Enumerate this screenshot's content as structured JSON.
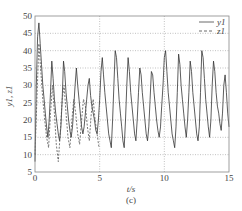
{
  "chart_data": {
    "type": "line",
    "title": "",
    "caption": "(c)",
    "xlabel": "t/s",
    "ylabel": "y1, z1",
    "xlim": [
      0,
      15
    ],
    "ylim": [
      5,
      50
    ],
    "xticks": [
      0,
      5,
      10,
      15
    ],
    "yticks": [
      5,
      10,
      15,
      20,
      25,
      30,
      35,
      40,
      45,
      50
    ],
    "grid": true,
    "grid_style": "dotted",
    "legend_position": "upper right",
    "legend": [
      {
        "label": "y1",
        "style": "solid"
      },
      {
        "label": "z1",
        "style": "dashed"
      }
    ],
    "series": [
      {
        "name": "y1",
        "style": "solid",
        "x": [
          0,
          0.1,
          0.2,
          0.3,
          0.4,
          0.5,
          0.6,
          0.7,
          0.8,
          0.9,
          1.0,
          1.1,
          1.2,
          1.3,
          1.4,
          1.5,
          1.6,
          1.7,
          1.8,
          1.9,
          2.0,
          2.1,
          2.2,
          2.3,
          2.4,
          2.5,
          2.6,
          2.7,
          2.8,
          2.9,
          3.0,
          3.1,
          3.2,
          3.3,
          3.4,
          3.5,
          3.6,
          3.7,
          3.8,
          3.9,
          4.0,
          4.1,
          4.2,
          4.3,
          4.4,
          4.5,
          4.6,
          4.7,
          4.8,
          4.9,
          5.0,
          5.1,
          5.2,
          5.3,
          5.4,
          5.5,
          5.6,
          5.7,
          5.8,
          5.9,
          6.0,
          6.1,
          6.2,
          6.3,
          6.4,
          6.5,
          6.6,
          6.7,
          6.8,
          6.9,
          7.0,
          7.1,
          7.2,
          7.3,
          7.4,
          7.5,
          7.6,
          7.7,
          7.8,
          7.9,
          8.0,
          8.1,
          8.2,
          8.3,
          8.4,
          8.5,
          8.6,
          8.7,
          8.8,
          8.9,
          9.0,
          9.1,
          9.2,
          9.3,
          9.4,
          9.5,
          9.6,
          9.7,
          9.8,
          9.9,
          10.0,
          10.1,
          10.2,
          10.3,
          10.4,
          10.5,
          10.6,
          10.7,
          10.8,
          10.9,
          11.0,
          11.1,
          11.2,
          11.3,
          11.4,
          11.5,
          11.6,
          11.7,
          11.8,
          11.9,
          12.0,
          12.1,
          12.2,
          12.3,
          12.4,
          12.5,
          12.6,
          12.7,
          12.8,
          12.9,
          13.0,
          13.1,
          13.2,
          13.3,
          13.4,
          13.5,
          13.6,
          13.7,
          13.8,
          13.9,
          14.0,
          14.1,
          14.2,
          14.3,
          14.4,
          14.5,
          14.6,
          14.7,
          14.8,
          14.9,
          15.0
        ],
        "values": [
          8,
          30,
          44,
          48,
          42,
          36,
          30,
          26,
          22,
          18,
          15,
          20,
          28,
          37,
          32,
          26,
          22,
          19,
          16,
          14,
          18,
          26,
          37,
          34,
          28,
          24,
          20,
          17,
          15,
          18,
          24,
          30,
          35,
          30,
          26,
          22,
          18,
          16,
          18,
          22,
          26,
          30,
          32,
          27,
          24,
          22,
          20,
          17,
          16,
          20,
          26,
          34,
          38,
          33,
          28,
          24,
          20,
          16,
          14,
          12,
          20,
          30,
          40,
          38,
          32,
          26,
          22,
          18,
          14,
          12,
          20,
          30,
          38,
          34,
          28,
          24,
          20,
          16,
          14,
          20,
          28,
          35,
          33,
          28,
          24,
          20,
          16,
          14,
          18,
          26,
          34,
          33,
          28,
          24,
          20,
          17,
          15,
          18,
          24,
          30,
          38,
          40,
          34,
          28,
          24,
          20,
          16,
          14,
          12,
          18,
          28,
          39,
          36,
          30,
          26,
          22,
          18,
          15,
          20,
          28,
          37,
          34,
          28,
          24,
          20,
          16,
          14,
          18,
          28,
          40,
          38,
          32,
          26,
          22,
          18,
          15,
          20,
          30,
          37,
          34,
          28,
          24,
          22,
          19,
          17,
          22,
          30,
          33,
          28,
          22,
          18
        ]
      },
      {
        "name": "z1",
        "style": "dashed",
        "x": [
          0,
          0.15,
          0.3,
          0.45,
          0.6,
          0.75,
          0.9,
          1.05,
          1.2,
          1.35,
          1.5,
          1.65,
          1.8,
          1.95,
          2.1,
          2.25,
          2.4,
          2.55,
          2.7,
          2.85,
          3.0,
          3.15,
          3.3,
          3.45,
          3.6,
          3.75,
          3.9,
          4.05,
          4.2,
          4.35,
          4.5,
          4.65,
          4.8,
          4.95
        ],
        "values": [
          10,
          26,
          42,
          34,
          26,
          20,
          15,
          12,
          22,
          30,
          22,
          13,
          8,
          16,
          26,
          30,
          22,
          15,
          12,
          20,
          26,
          22,
          16,
          13,
          20,
          26,
          24,
          18,
          14,
          22,
          26,
          20,
          16,
          12
        ]
      }
    ]
  }
}
